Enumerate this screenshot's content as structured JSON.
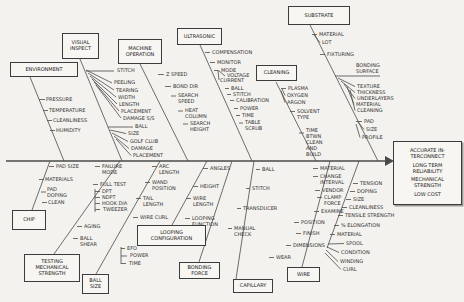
{
  "colors": {
    "ink": "#4a4a4a",
    "paper": "#f3f2ef"
  },
  "fishbone": {
    "effect": [
      "ACCURATE IN-TERCONNECT",
      "LONG TERM RELIABILITY",
      "MECHANICAL STRENGTH",
      "LOW COST"
    ],
    "top": [
      {
        "box": "ENVIRONMENT",
        "items": [
          "PRESSURE",
          "TEMPERATURE",
          "CLEANLINESS",
          "HUMIDITY"
        ]
      },
      {
        "box": "VISUAL INSPECT",
        "items": [
          "STITCH",
          "PEELING",
          "TEARING",
          "WIDTH",
          "LENGTH",
          "PLACEMENT",
          "DAMAGE S/S",
          "BALL",
          "SIZE",
          "GOLF CLUB",
          "DAMAGE",
          "PLACEMENT"
        ]
      },
      {
        "box": "MACHINE OPERATION",
        "items": [
          "Z SPEED",
          "BOND DIR",
          "SEARCH SPEED",
          "HEAT COLUMN",
          "SEARCH HEIGHT"
        ]
      },
      {
        "box": "ULTRASONIC",
        "items": [
          "COMPENSATION",
          "MONITOR",
          "MODE",
          "VOLTAGE",
          "CURRENT",
          "BALL",
          "STITCH",
          "CALIBRATION",
          "POWER",
          "TIME",
          "TABLE SCRUB"
        ]
      },
      {
        "box": "CLEANING",
        "items": [
          "PLASMA",
          "OXYGEN",
          "ARGON",
          "SOLVENT TYPE",
          "TIME BTWN CLEAN AND BUILD"
        ]
      },
      {
        "box": "SUBSTRATE",
        "items": [
          "MATERIAL",
          "LOT",
          "FIXTURING",
          "BONDING SURFACE",
          "TEXTURE",
          "THICKNESS",
          "UNDERLAYERS",
          "MATERIAL",
          "CLEANING",
          "PAD",
          "SIZE",
          "PROFILE"
        ]
      }
    ],
    "bottom": [
      {
        "box": "CHIP",
        "items": [
          "PAD SIZE",
          "MATERIALS",
          "PAD DOPING",
          "CLEAN"
        ]
      },
      {
        "box": "TESTING MECHANICAL STRENGTH",
        "items": [
          "FAILURE MODE",
          "FULL TEST",
          "DPT",
          "NDPT",
          "HOOK DIA",
          "TWEEZER",
          "AGING",
          "BALL SHEAR"
        ]
      },
      {
        "box": "BALL SIZE",
        "items": [
          "ARC LENGTH",
          "WAND POSITION",
          "TAIL LENGTH",
          "WIRE CURL",
          "EFO",
          "POWER",
          "TIME"
        ]
      },
      {
        "box": "LOOPING CONFIGURATION",
        "items": [
          "ANGLES",
          "HEIGHT",
          "WIRE LENGTH",
          "LOOPING FUNCTION"
        ]
      },
      {
        "box": "BONDING FORCE",
        "items": []
      },
      {
        "box": "CAPILLARY",
        "items": [
          "BALL",
          "STITCH",
          "TRANSDUCER",
          "MANUAL CHECK"
        ]
      },
      {
        "box": "WIRE",
        "items": [
          "MATERIAL",
          "CHANGE INTERVAL",
          "VENDOR",
          "CLAMP FORCE",
          "EXAMINE",
          "POSITION",
          "FINISH",
          "DIMENSIONS",
          "WEAR"
        ]
      },
      {
        "box": "",
        "items": [
          "TENSION",
          "DOPING",
          "SIZE",
          "CLEANLINESS",
          "TENSILE STRENGTH",
          "% ELONGATION",
          "MATERIAL",
          "SPOOL",
          "CONDITION",
          "WINDING",
          "CURL"
        ]
      }
    ]
  }
}
